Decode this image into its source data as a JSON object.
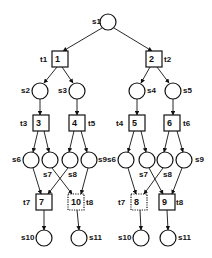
{
  "colors": {
    "stroke": "#111111",
    "background": "#ffffff"
  },
  "places": [
    {
      "id": "s1",
      "label": "s1",
      "cx": 108,
      "cy": 22,
      "lx": 92,
      "ly": 24
    },
    {
      "id": "s2",
      "label": "s2",
      "cx": 40,
      "cy": 91,
      "lx": 21,
      "ly": 93
    },
    {
      "id": "s3",
      "label": "s3",
      "cx": 77,
      "cy": 91,
      "lx": 58,
      "ly": 93
    },
    {
      "id": "s4",
      "label": "s4",
      "cx": 137,
      "cy": 91,
      "lx": 147,
      "ly": 93
    },
    {
      "id": "s5",
      "label": "s5",
      "cx": 173,
      "cy": 91,
      "lx": 183,
      "ly": 93
    },
    {
      "id": "s6L",
      "label": "s6",
      "cx": 31,
      "cy": 160,
      "lx": 12,
      "ly": 162
    },
    {
      "id": "s7L",
      "label": "s7",
      "cx": 50,
      "cy": 160,
      "lx": 43,
      "ly": 177
    },
    {
      "id": "s8L",
      "label": "s8",
      "cx": 70,
      "cy": 160,
      "lx": 68,
      "ly": 177
    },
    {
      "id": "s9L",
      "label": "s9",
      "cx": 89,
      "cy": 160,
      "lx": 98,
      "ly": 162
    },
    {
      "id": "s6R",
      "label": "s6",
      "cx": 126,
      "cy": 160,
      "lx": 107,
      "ly": 162
    },
    {
      "id": "s7R",
      "label": "s7",
      "cx": 147,
      "cy": 160,
      "lx": 139,
      "ly": 177
    },
    {
      "id": "s8R",
      "label": "s8",
      "cx": 165,
      "cy": 160,
      "lx": 163,
      "ly": 177
    },
    {
      "id": "s9R",
      "label": "s9",
      "cx": 184,
      "cy": 160,
      "lx": 195,
      "ly": 162
    },
    {
      "id": "s10L",
      "label": "s10",
      "cx": 44,
      "cy": 238,
      "lx": 21,
      "ly": 240
    },
    {
      "id": "s11L",
      "label": "s11",
      "cx": 79,
      "cy": 238,
      "lx": 89,
      "ly": 240
    },
    {
      "id": "s10R",
      "label": "s10",
      "cx": 141,
      "cy": 238,
      "lx": 118,
      "ly": 240
    },
    {
      "id": "s11R",
      "label": "s11",
      "cx": 168,
      "cy": 238,
      "lx": 178,
      "ly": 240
    }
  ],
  "transitions": [
    {
      "id": "t1",
      "inner": "1",
      "label": "t1",
      "x": 52,
      "y": 51,
      "dotted": false,
      "lx": 40,
      "ly": 62
    },
    {
      "id": "t2",
      "inner": "2",
      "label": "t2",
      "x": 146,
      "y": 51,
      "dotted": false,
      "lx": 164,
      "ly": 62
    },
    {
      "id": "t3",
      "inner": "3",
      "label": "t3",
      "x": 33,
      "y": 115,
      "dotted": false,
      "lx": 20,
      "ly": 126
    },
    {
      "id": "t5",
      "inner": "4",
      "label": "t5",
      "x": 69,
      "y": 115,
      "dotted": false,
      "lx": 88,
      "ly": 126
    },
    {
      "id": "t4",
      "inner": "5",
      "label": "t4",
      "x": 129,
      "y": 115,
      "dotted": false,
      "lx": 116,
      "ly": 126
    },
    {
      "id": "t6",
      "inner": "6",
      "label": "t6",
      "x": 164,
      "y": 115,
      "dotted": false,
      "lx": 183,
      "ly": 126
    },
    {
      "id": "t7L",
      "inner": "7",
      "label": "t7",
      "x": 36,
      "y": 194,
      "dotted": false,
      "lx": 23,
      "ly": 205
    },
    {
      "id": "t8L",
      "inner": "10",
      "label": "t8",
      "x": 68,
      "y": 194,
      "dotted": true,
      "lx": 86,
      "ly": 205
    },
    {
      "id": "t7R",
      "inner": "8",
      "label": "t7",
      "x": 131,
      "y": 194,
      "dotted": true,
      "lx": 118,
      "ly": 205
    },
    {
      "id": "t8R",
      "inner": "9",
      "label": "t8",
      "x": 159,
      "y": 194,
      "dotted": false,
      "lx": 176,
      "ly": 205
    }
  ],
  "box_size": 16,
  "place_radius": 8,
  "edges": [
    [
      102,
      28,
      63,
      51
    ],
    [
      114,
      28,
      152,
      51
    ],
    [
      57,
      67,
      44,
      83
    ],
    [
      62,
      67,
      73,
      83
    ],
    [
      150,
      67,
      141,
      83
    ],
    [
      157,
      67,
      169,
      83
    ],
    [
      40,
      99,
      40,
      115
    ],
    [
      77,
      99,
      77,
      115
    ],
    [
      137,
      99,
      137,
      115
    ],
    [
      173,
      99,
      173,
      115
    ],
    [
      38,
      131,
      33,
      152
    ],
    [
      44,
      131,
      49,
      152
    ],
    [
      74,
      131,
      69,
      152
    ],
    [
      81,
      131,
      87,
      152
    ],
    [
      134,
      131,
      128,
      152
    ],
    [
      141,
      131,
      146,
      152
    ],
    [
      169,
      131,
      164,
      152
    ],
    [
      177,
      131,
      183,
      152
    ],
    [
      33,
      168,
      41,
      194
    ],
    [
      68,
      168,
      48,
      194
    ],
    [
      52,
      168,
      72,
      194
    ],
    [
      88,
      168,
      81,
      194
    ],
    [
      128,
      168,
      136,
      194
    ],
    [
      163,
      168,
      144,
      194
    ],
    [
      149,
      168,
      163,
      194
    ],
    [
      182,
      168,
      172,
      194
    ],
    [
      44,
      210,
      44,
      230
    ],
    [
      77,
      210,
      79,
      230
    ],
    [
      140,
      210,
      141,
      230
    ],
    [
      167,
      210,
      168,
      230
    ]
  ]
}
